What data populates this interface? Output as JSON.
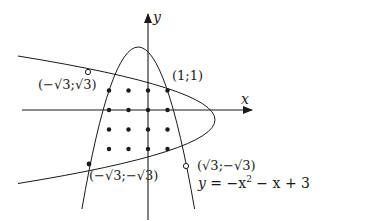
{
  "figure": {
    "axes": {
      "x_label": "x",
      "y_label": "y"
    },
    "curves": [
      {
        "name": "vertical-parabola",
        "equation": "y = −x² − x + 3"
      },
      {
        "name": "horizontal-parabola",
        "equation": "x = −y² − y + 3"
      }
    ],
    "equation_label": {
      "y": "y",
      "rest": " = −x",
      "sup": "2",
      "tail": " − x + 3"
    },
    "points": [
      {
        "label": "(1;1)",
        "style": "filled"
      },
      {
        "label": "(−√3;√3)",
        "style": "open"
      },
      {
        "label": "(−√3;−√3)",
        "style": "filled"
      },
      {
        "label": "(√3;−√3)",
        "style": "open"
      }
    ],
    "integer_points": [
      [
        -2,
        1
      ],
      [
        -1,
        1
      ],
      [
        0,
        1
      ],
      [
        1,
        1
      ],
      [
        -2,
        0
      ],
      [
        -1,
        0
      ],
      [
        0,
        0
      ],
      [
        1,
        0
      ],
      [
        -2,
        -1
      ],
      [
        -1,
        -1
      ],
      [
        0,
        -1
      ],
      [
        1,
        -1
      ],
      [
        -2,
        -2
      ],
      [
        -1,
        -2
      ],
      [
        0,
        -2
      ],
      [
        1,
        -2
      ]
    ],
    "colors": {
      "stroke": "#1a1a1a",
      "background": "#ffffff"
    }
  }
}
